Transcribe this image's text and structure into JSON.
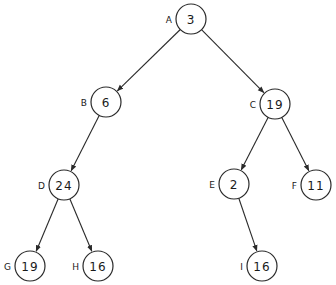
{
  "diagram": {
    "type": "binary-tree",
    "nodes": [
      {
        "id": "A",
        "label": "A",
        "value": "3",
        "x": 191,
        "y": 19
      },
      {
        "id": "B",
        "label": "B",
        "value": "6",
        "x": 106,
        "y": 102
      },
      {
        "id": "C",
        "label": "C",
        "value": "19",
        "x": 275,
        "y": 104
      },
      {
        "id": "D",
        "label": "D",
        "value": "24",
        "x": 64,
        "y": 185
      },
      {
        "id": "E",
        "label": "E",
        "value": "2",
        "x": 234,
        "y": 184
      },
      {
        "id": "F",
        "label": "F",
        "value": "11",
        "x": 316,
        "y": 185
      },
      {
        "id": "G",
        "label": "G",
        "value": "19",
        "x": 30,
        "y": 266
      },
      {
        "id": "H",
        "label": "H",
        "value": "16",
        "x": 98,
        "y": 266
      },
      {
        "id": "I",
        "label": "I",
        "value": "16",
        "x": 262,
        "y": 266
      }
    ],
    "edges": [
      {
        "from": "A",
        "to": "B"
      },
      {
        "from": "A",
        "to": "C"
      },
      {
        "from": "B",
        "to": "D"
      },
      {
        "from": "C",
        "to": "E"
      },
      {
        "from": "C",
        "to": "F"
      },
      {
        "from": "D",
        "to": "G"
      },
      {
        "from": "D",
        "to": "H"
      },
      {
        "from": "E",
        "to": "I"
      }
    ],
    "node_radius": 15,
    "colors": {
      "stroke": "#2a2a2a",
      "fill": "#ffffff",
      "text": "#1a1a1a"
    }
  }
}
